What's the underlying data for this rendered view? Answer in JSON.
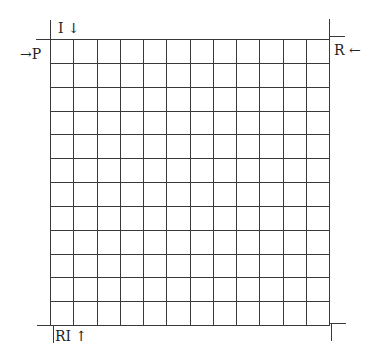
{
  "diagram": {
    "type": "grid",
    "rows": 12,
    "columns": 12,
    "line_color": "#3a3a3a",
    "labels": {
      "top_left": "I ↓",
      "left": "→P",
      "right": "R ←",
      "bottom_left": "RI ↑"
    }
  }
}
